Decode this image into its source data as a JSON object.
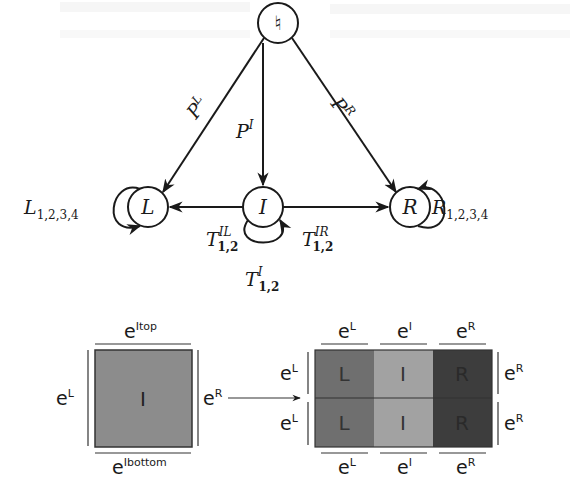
{
  "state_graph": {
    "nodes": {
      "top": "♮",
      "left": "L",
      "center": "I",
      "right": "R"
    },
    "edge_labels": {
      "top_to_left": {
        "base": "P",
        "sup": "L"
      },
      "top_to_center": {
        "base": "P",
        "sup": "I"
      },
      "top_to_right": {
        "base": "P",
        "sup": "R"
      },
      "center_to_left": {
        "base": "T",
        "sup": "IL",
        "sub": "1,2"
      },
      "center_to_right": {
        "base": "T",
        "sup": "IR",
        "sub": "1,2"
      },
      "center_self": {
        "base": "T",
        "sup": "I",
        "sub": "1,2"
      },
      "left_self": {
        "base": "L",
        "sub": "1,2,3,4"
      },
      "right_self": {
        "base": "R",
        "sub": "1,2,3,4"
      }
    }
  },
  "block_diagram": {
    "single_block": {
      "label": "I",
      "fill": "#8c8c8c",
      "edges": {
        "top": {
          "base": "e",
          "sup": "Itop"
        },
        "bottom": {
          "base": "e",
          "sup": "Ibottom"
        },
        "left": {
          "base": "e",
          "sup": "L"
        },
        "right": {
          "base": "e",
          "sup": "R"
        }
      }
    },
    "split_block": {
      "columns": [
        {
          "label": "L",
          "fill": "#6f6f6f",
          "edge": {
            "base": "e",
            "sup": "L"
          }
        },
        {
          "label": "I",
          "fill": "#a2a2a2",
          "edge": {
            "base": "e",
            "sup": "I"
          }
        },
        {
          "label": "R",
          "fill": "#3d3d3d",
          "edge": {
            "base": "e",
            "sup": "R"
          }
        }
      ],
      "rows": 2,
      "left_edges": [
        {
          "base": "e",
          "sup": "L"
        },
        {
          "base": "e",
          "sup": "L"
        }
      ],
      "right_edges": [
        {
          "base": "e",
          "sup": "R"
        },
        {
          "base": "e",
          "sup": "R"
        }
      ]
    }
  },
  "colors": {
    "stroke": "#1a1a1a",
    "text": "#1a1a1a"
  }
}
